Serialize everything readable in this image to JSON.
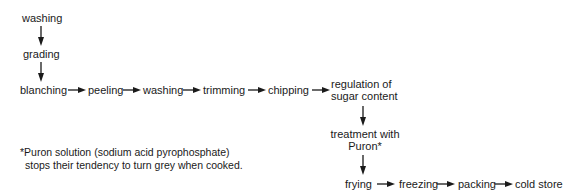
{
  "diagram": {
    "type": "flowchart",
    "title": "",
    "nodes": {
      "washing1": "washing",
      "grading": "grading",
      "blanching": "blanching",
      "peeling": "peeling",
      "washing2": "washing",
      "trimming": "trimming",
      "chipping": "chipping",
      "regulation_line1": "regulation of",
      "regulation_line2": "sugar content",
      "treatment_line1": "treatment with",
      "treatment_line2": "Puron*",
      "frying": "frying",
      "freezing": "freezing",
      "packing": "packing",
      "cold_store": "cold store"
    },
    "edges": [
      [
        "washing",
        "grading"
      ],
      [
        "grading",
        "blanching"
      ],
      [
        "blanching",
        "peeling"
      ],
      [
        "peeling",
        "washing"
      ],
      [
        "washing",
        "trimming"
      ],
      [
        "trimming",
        "chipping"
      ],
      [
        "chipping",
        "regulation of sugar content"
      ],
      [
        "regulation of sugar content",
        "treatment with Puron*"
      ],
      [
        "treatment with Puron*",
        "frying"
      ],
      [
        "frying",
        "freezing"
      ],
      [
        "freezing",
        "packing"
      ],
      [
        "packing",
        "cold store"
      ]
    ],
    "footnote": {
      "line1": "*Puron solution (sodium acid pyrophosphate)",
      "line2": "stops their tendency to turn grey when cooked."
    }
  }
}
